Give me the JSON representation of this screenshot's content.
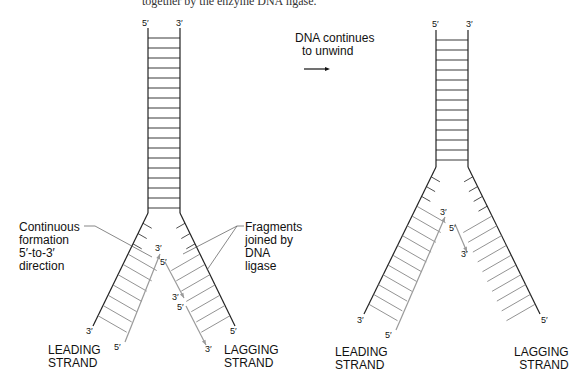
{
  "caption": "together by the enzyme DNA ligase.",
  "arrow_label": [
    "DNA continues",
    "to unwind"
  ],
  "left_fork": {
    "stem_top": {
      "left": "5′",
      "right": "3′"
    },
    "annotation_left": [
      "Continuous",
      "formation",
      "5′-to-3′",
      "direction"
    ],
    "annotation_right": [
      "Fragments",
      "joined by",
      "DNA",
      "ligase"
    ],
    "leading_inner_top": "3′",
    "leading_inner_bottom": "5′",
    "leading_outer_bottom": "3′",
    "lagging_frag_top": "5′",
    "lagging_frag_mid_3": "3′",
    "lagging_frag_mid_5": "5′",
    "lagging_frag_bottom": "3′",
    "lagging_outer_bottom": "5′",
    "leading_label": [
      "LEADING",
      "STRAND"
    ],
    "lagging_label": [
      "LAGGING",
      "STRAND"
    ]
  },
  "right_fork": {
    "stem_top": {
      "left": "5′",
      "right": "3′"
    },
    "leading_inner_top": "3′",
    "leading_outer_bottom": "3′",
    "leading_inner_bottom": "5′",
    "lagging_frag_top": "5′",
    "lagging_frag_bottom": "3′",
    "lagging_outer_bottom": "5′",
    "leading_label": [
      "LEADING",
      "STRAND"
    ],
    "lagging_label": [
      "LAGGING",
      "STRAND"
    ]
  },
  "colors": {
    "template_strand": "#222222",
    "new_strand": "#9a9a9a",
    "annotation_line": "#555555"
  }
}
